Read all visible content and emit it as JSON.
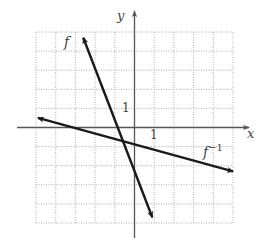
{
  "chart_data": {
    "type": "line",
    "title": "",
    "xlabel": "x",
    "ylabel": "y",
    "xlim": [
      -5,
      5
    ],
    "ylim": [
      -5,
      5
    ],
    "grid": true,
    "grid_style": "dotted",
    "tick_labels": {
      "x": [
        "1"
      ],
      "y": [
        "1"
      ]
    },
    "series": [
      {
        "name": "f",
        "label": "f",
        "equation_estimate": "y = -3x - 3",
        "points": [
          [
            -2.6,
            4.7
          ],
          [
            0.9,
            -4.7
          ]
        ],
        "arrows": "both"
      },
      {
        "name": "f^-1",
        "label": "f",
        "label_superscript": "−1",
        "equation_estimate": "y = -x/3 - 1",
        "points": [
          [
            -4.9,
            0.5
          ],
          [
            5.0,
            -2.3
          ]
        ],
        "arrows": "both"
      }
    ],
    "intersection": [
      -0.75,
      -0.75
    ],
    "legend": "none",
    "annotations": [
      "f",
      "f^-1"
    ]
  },
  "labels": {
    "x_axis": "x",
    "y_axis": "y",
    "x_tick_1": "1",
    "y_tick_1": "1",
    "f": "f",
    "finv_base": "f",
    "finv_sup": "−1"
  },
  "colors": {
    "line": "#1a1a1a",
    "axis": "#555555",
    "grid": "#9a9a9a",
    "text": "#444444"
  }
}
